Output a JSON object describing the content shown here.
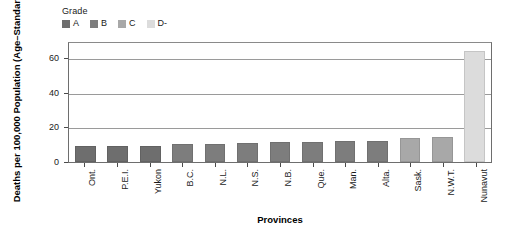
{
  "chart_data": {
    "type": "bar",
    "title": "",
    "xlabel": "Provinces",
    "ylabel": "Deaths per 100,000 Population (Age–Standardized)",
    "categories": [
      "Ont.",
      "P.E.I.",
      "Yukon",
      "B.C.",
      "N.L.",
      "N.S.",
      "N.B.",
      "Que.",
      "Man.",
      "Alta.",
      "Sask.",
      "N.W.T.",
      "Nunavut"
    ],
    "values": [
      9.0,
      9.0,
      9.2,
      10.3,
      10.5,
      10.8,
      11.5,
      11.5,
      12.0,
      12.0,
      14.0,
      14.2,
      64.0
    ],
    "grades": [
      "A",
      "A",
      "A",
      "B",
      "B",
      "B",
      "B",
      "B",
      "B",
      "B",
      "C",
      "C",
      "D-"
    ],
    "ylim": [
      0,
      70
    ],
    "yticks": [
      0,
      20,
      40,
      60
    ],
    "ytick_labels": [
      "0",
      "20",
      "40",
      "60"
    ],
    "grid": "horizontal",
    "legend_position": "top-left"
  },
  "legend": {
    "title": "Grade",
    "items": [
      {
        "label": "A",
        "color": "#6e6e6e"
      },
      {
        "label": "B",
        "color": "#7d7d7d"
      },
      {
        "label": "C",
        "color": "#a8a8a8"
      },
      {
        "label": "D-",
        "color": "#dcdcdc"
      }
    ]
  },
  "colors": {
    "grade_a": "#6e6e6e",
    "grade_b": "#7d7d7d",
    "grade_c": "#a8a8a8",
    "grade_dminus": "#dcdcdc",
    "axis": "#4a4a4a",
    "grid": "#9a9a9a",
    "background": "#ffffff",
    "text": "#1a1a1a"
  }
}
